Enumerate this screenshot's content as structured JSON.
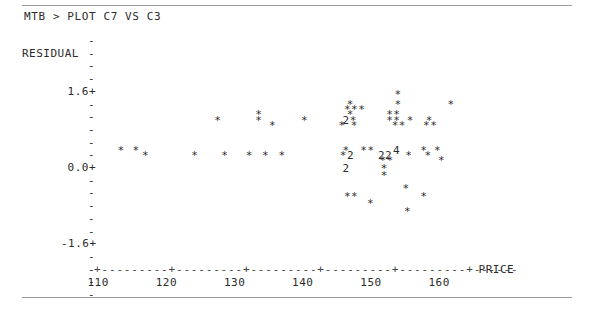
{
  "terminal": {
    "prompt": "MTB > PLOT C7 VS C3",
    "background_color": "#ffffff",
    "text_color": "#2b2b2b",
    "rule_color": "#9a9a9a"
  },
  "chart_data": {
    "type": "scatter",
    "title": "",
    "xlabel": "PRICE",
    "ylabel": "RESIDUAL",
    "xlim": [
      110,
      165
    ],
    "ylim": [
      -2.6,
      2.4
    ],
    "grid": false,
    "legend": null,
    "y_axis": {
      "label": "RESIDUAL",
      "tick_marks": [
        "-",
        "-",
        "-",
        "-",
        "-",
        "-",
        "-",
        "-",
        "-",
        "-",
        "-",
        "-",
        "-",
        "-",
        "-",
        "-",
        "-",
        "-",
        "-",
        "-",
        "-"
      ],
      "labeled_ticks": [
        {
          "label": "1.6+",
          "value": 1.6
        },
        {
          "label": "0.0+",
          "value": 0.0
        },
        {
          "label": "-1.6+",
          "value": -1.6
        }
      ],
      "axis_char": "-",
      "major_char": "+"
    },
    "x_axis": {
      "label": "PRICE",
      "tick_labels": [
        "110",
        "120",
        "130",
        "140",
        "150",
        "160"
      ],
      "tick_values": [
        110,
        120,
        130,
        140,
        150,
        160
      ],
      "axis_pattern": "+---------+---------+---------+---------+---------+------"
    },
    "point_symbol": "*",
    "count_symbols_note": "digits denote number of coincident points",
    "rows": [
      {
        "y": 2.2,
        "marks": [
          {
            "x": 154.0,
            "text": "*"
          }
        ]
      },
      {
        "y": 1.8,
        "marks": [
          {
            "x": 147.0,
            "text": "*"
          },
          {
            "x": 154.0,
            "text": "*"
          },
          {
            "x": 161.8,
            "text": "*"
          }
        ]
      },
      {
        "y": 1.6,
        "marks": [
          {
            "x": 146.6,
            "text": "***"
          }
        ]
      },
      {
        "y": 1.4,
        "marks": [
          {
            "x": 133.6,
            "text": "*"
          },
          {
            "x": 147.0,
            "text": "*"
          },
          {
            "x": 152.8,
            "text": "**"
          }
        ]
      },
      {
        "y": 1.2,
        "marks": [
          {
            "x": 127.6,
            "text": "*"
          },
          {
            "x": 133.6,
            "text": "*"
          },
          {
            "x": 140.3,
            "text": "*"
          },
          {
            "x": 146.4,
            "text": "2*"
          },
          {
            "x": 152.8,
            "text": "**"
          },
          {
            "x": 155.8,
            "text": "*"
          },
          {
            "x": 158.6,
            "text": "*"
          }
        ]
      },
      {
        "y": 1.0,
        "marks": [
          {
            "x": 135.6,
            "text": "*"
          },
          {
            "x": 145.8,
            "text": "*"
          },
          {
            "x": 147.6,
            "text": "*"
          },
          {
            "x": 153.6,
            "text": "**"
          },
          {
            "x": 158.2,
            "text": "**"
          }
        ]
      },
      {
        "y": 0.0,
        "marks": [
          {
            "x": 113.4,
            "text": "*"
          },
          {
            "x": 115.6,
            "text": "*"
          },
          {
            "x": 146.4,
            "text": "*"
          },
          {
            "x": 149.0,
            "text": "**"
          },
          {
            "x": 153.8,
            "text": "4"
          },
          {
            "x": 157.8,
            "text": "*"
          },
          {
            "x": 159.8,
            "text": "*"
          }
        ]
      },
      {
        "y": -0.2,
        "marks": [
          {
            "x": 117.0,
            "text": "*"
          },
          {
            "x": 124.2,
            "text": "*"
          },
          {
            "x": 128.6,
            "text": "*"
          },
          {
            "x": 132.2,
            "text": "*"
          },
          {
            "x": 134.6,
            "text": "*"
          },
          {
            "x": 137.0,
            "text": "*"
          },
          {
            "x": 146.0,
            "text": "*2"
          },
          {
            "x": 151.6,
            "text": "22"
          },
          {
            "x": 155.6,
            "text": "*"
          },
          {
            "x": 158.4,
            "text": "*"
          }
        ]
      },
      {
        "y": -0.4,
        "marks": [
          {
            "x": 151.8,
            "text": "**"
          },
          {
            "x": 160.4,
            "text": "*"
          }
        ]
      },
      {
        "y": -0.7,
        "marks": [
          {
            "x": 146.4,
            "text": "2"
          },
          {
            "x": 152.0,
            "text": "*"
          }
        ]
      },
      {
        "y": -1.0,
        "marks": [
          {
            "x": 152.0,
            "text": "*"
          }
        ]
      },
      {
        "y": -1.5,
        "marks": [
          {
            "x": 155.2,
            "text": "*"
          }
        ]
      },
      {
        "y": -1.8,
        "marks": [
          {
            "x": 146.6,
            "text": "**"
          },
          {
            "x": 157.8,
            "text": "*"
          }
        ]
      },
      {
        "y": -2.1,
        "marks": [
          {
            "x": 150.0,
            "text": "*"
          }
        ]
      },
      {
        "y": -2.4,
        "marks": [
          {
            "x": 155.4,
            "text": "*"
          }
        ]
      }
    ]
  }
}
